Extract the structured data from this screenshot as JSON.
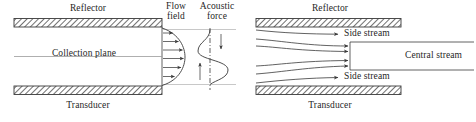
{
  "figure": {
    "type": "schematic-diagram",
    "panel_count": 2,
    "colors": {
      "stroke": "#3a3a3a",
      "hatch": "#555555",
      "text": "#1f1f1f",
      "wall_fill": "#ffffff",
      "background": "#ffffff"
    }
  },
  "left_panel": {
    "name": "flow-field-and-acoustic-force",
    "labels": {
      "reflector": "Reflector",
      "transducer": "Transducer",
      "collection_plane": "Collection plane",
      "flow_field_line1": "Flow",
      "flow_field_line2": "field",
      "acoustic_force_line1": "Acoustic",
      "acoustic_force_line2": "force"
    },
    "flow_profile": {
      "shape": "parabolic",
      "arrow_count": 6,
      "direction": "left-to-right"
    },
    "acoustic_force_profile": {
      "shape": "sinusoidal",
      "centerline_style": "dash-dot",
      "arrows": [
        {
          "name": "upper-force-arrow",
          "direction": "down"
        },
        {
          "name": "lower-force-arrow",
          "direction": "up"
        }
      ]
    }
  },
  "right_panel": {
    "name": "stream-splitting",
    "labels": {
      "reflector": "Reflector",
      "transducer": "Transducer",
      "side_stream_top": "Side stream",
      "side_stream_bottom": "Side stream",
      "central_stream": "Central stream"
    },
    "streamlines": {
      "total": 6,
      "to_side_streams": 2,
      "to_central_stream": 4,
      "direction": "left-to-right"
    }
  }
}
